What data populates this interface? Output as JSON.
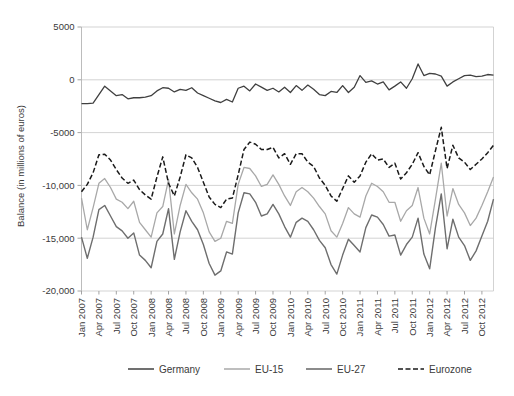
{
  "chart_data": {
    "type": "line",
    "title": "",
    "xlabel": "",
    "ylabel": "Balance (in millions of euros)",
    "ylim": [
      -20000,
      5000
    ],
    "yticks": [
      5000,
      0,
      -5000,
      -10000,
      -15000,
      -20000
    ],
    "ytick_labels": [
      "5000",
      "0",
      "-5000",
      "-10,000",
      "-15,000",
      "-20,000"
    ],
    "grid": true,
    "legend_position": "bottom",
    "x_start": "Jan 2007",
    "x_end": "Dec 2012",
    "x_tick_interval_months": 3,
    "xtick_labels": [
      "Jan 2007",
      "Apr 2007",
      "Jul 2007",
      "Oct 2007",
      "Jan 2008",
      "Apr 2008",
      "Jul 2008",
      "Oct 2008",
      "Jan 2009",
      "Apr 2009",
      "Jul 2009",
      "Oct 2009",
      "Jan 2010",
      "Apr 2010",
      "Jul 2010",
      "Oct 2010",
      "Jan 2011",
      "Apr 2011",
      "Jul 2011",
      "Oct 2011",
      "Jan 2012",
      "Apr 2012",
      "Jul 2012",
      "Oct 2012"
    ],
    "x": [
      "Jan 2007",
      "Feb 2007",
      "Mar 2007",
      "Apr 2007",
      "May 2007",
      "Jun 2007",
      "Jul 2007",
      "Aug 2007",
      "Sep 2007",
      "Oct 2007",
      "Nov 2007",
      "Dec 2007",
      "Jan 2008",
      "Feb 2008",
      "Mar 2008",
      "Apr 2008",
      "May 2008",
      "Jun 2008",
      "Jul 2008",
      "Aug 2008",
      "Sep 2008",
      "Oct 2008",
      "Nov 2008",
      "Dec 2008",
      "Jan 2009",
      "Feb 2009",
      "Mar 2009",
      "Apr 2009",
      "May 2009",
      "Jun 2009",
      "Jul 2009",
      "Aug 2009",
      "Sep 2009",
      "Oct 2009",
      "Nov 2009",
      "Dec 2009",
      "Jan 2010",
      "Feb 2010",
      "Mar 2010",
      "Apr 2010",
      "May 2010",
      "Jun 2010",
      "Jul 2010",
      "Aug 2010",
      "Sep 2010",
      "Oct 2010",
      "Nov 2010",
      "Dec 2010",
      "Jan 2011",
      "Feb 2011",
      "Mar 2011",
      "Apr 2011",
      "May 2011",
      "Jun 2011",
      "Jul 2011",
      "Aug 2011",
      "Sep 2011",
      "Oct 2011",
      "Nov 2011",
      "Dec 2011",
      "Jan 2012",
      "Feb 2012",
      "Mar 2012",
      "Apr 2012",
      "May 2012",
      "Jun 2012",
      "Jul 2012",
      "Aug 2012",
      "Sep 2012",
      "Oct 2012",
      "Nov 2012",
      "Dec 2012"
    ],
    "series": [
      {
        "name": "Germany",
        "color": "#404040",
        "width": 1.3,
        "dash": "none",
        "values": [
          -2250,
          -2250,
          -2200,
          -1400,
          -600,
          -1050,
          -1500,
          -1400,
          -1800,
          -1700,
          -1700,
          -1650,
          -1500,
          -1050,
          -750,
          -800,
          -1150,
          -900,
          -1000,
          -750,
          -1250,
          -1500,
          -1750,
          -2000,
          -2150,
          -1850,
          -2100,
          -800,
          -600,
          -1050,
          -400,
          -700,
          -1000,
          -800,
          -1150,
          -700,
          -1200,
          -550,
          -1000,
          -500,
          -900,
          -1400,
          -1500,
          -1100,
          -1200,
          -550,
          -1200,
          -700,
          400,
          -250,
          -100,
          -400,
          -200,
          -950,
          -600,
          -200,
          -800,
          100,
          1500,
          400,
          600,
          550,
          350,
          -600,
          -200,
          100,
          400,
          450,
          300,
          350,
          500,
          450
        ]
      },
      {
        "name": "EU-15",
        "color": "#a8a8a8",
        "width": 1.3,
        "dash": "none",
        "values": [
          -11200,
          -14200,
          -12100,
          -9800,
          -9350,
          -10200,
          -11300,
          -11600,
          -12200,
          -11500,
          -13500,
          -14200,
          -14900,
          -12600,
          -12000,
          -9450,
          -14600,
          -11900,
          -9900,
          -10700,
          -11300,
          -12600,
          -14400,
          -15300,
          -15000,
          -13400,
          -13600,
          -9900,
          -8300,
          -8400,
          -9100,
          -10100,
          -9900,
          -9000,
          -9900,
          -11000,
          -11900,
          -10600,
          -10200,
          -10600,
          -11200,
          -12000,
          -12700,
          -14300,
          -14900,
          -13600,
          -12100,
          -12700,
          -13000,
          -11000,
          -9800,
          -10100,
          -10600,
          -11600,
          -11600,
          -13400,
          -12400,
          -11900,
          -10200,
          -13100,
          -14600,
          -11300,
          -7900,
          -12900,
          -10300,
          -11800,
          -12600,
          -13800,
          -13100,
          -11900,
          -10600,
          -9200
        ]
      },
      {
        "name": "EU-27",
        "color": "#6e6e6e",
        "width": 1.4,
        "dash": "none",
        "values": [
          -14900,
          -16900,
          -14900,
          -12300,
          -11900,
          -12900,
          -13900,
          -14300,
          -15000,
          -14500,
          -16600,
          -17100,
          -17800,
          -15300,
          -14600,
          -12200,
          -17000,
          -14400,
          -12400,
          -13400,
          -14200,
          -15600,
          -17400,
          -18500,
          -18100,
          -16300,
          -16500,
          -12600,
          -10700,
          -10800,
          -11600,
          -12900,
          -12700,
          -11800,
          -12700,
          -13900,
          -14900,
          -13500,
          -13100,
          -13400,
          -14200,
          -15200,
          -15900,
          -17500,
          -18400,
          -16600,
          -15100,
          -15700,
          -16300,
          -14000,
          -12800,
          -13000,
          -13700,
          -14800,
          -14700,
          -16600,
          -15600,
          -14900,
          -13100,
          -16500,
          -17900,
          -14000,
          -10800,
          -16000,
          -13200,
          -14900,
          -15700,
          -17100,
          -16200,
          -14800,
          -13400,
          -11300
        ]
      },
      {
        "name": "Eurozone",
        "color": "#1a1a1a",
        "width": 1.5,
        "dash": "5,2.5",
        "values": [
          -10600,
          -9900,
          -8800,
          -7100,
          -7050,
          -7600,
          -8500,
          -9300,
          -9800,
          -9500,
          -10400,
          -10900,
          -11300,
          -9200,
          -7300,
          -9800,
          -11000,
          -9200,
          -7100,
          -7400,
          -8300,
          -9700,
          -11100,
          -11800,
          -12100,
          -11300,
          -11200,
          -9000,
          -6600,
          -5900,
          -6100,
          -6600,
          -6600,
          -6400,
          -7400,
          -7000,
          -8000,
          -7000,
          -7000,
          -7800,
          -8200,
          -9300,
          -10000,
          -11000,
          -11500,
          -10300,
          -9100,
          -9700,
          -9100,
          -7800,
          -7000,
          -7600,
          -7500,
          -8300,
          -7900,
          -9400,
          -8800,
          -8000,
          -6900,
          -8200,
          -9000,
          -6700,
          -4500,
          -8400,
          -6200,
          -7400,
          -7800,
          -8500,
          -8000,
          -7500,
          -6900,
          -6200
        ]
      }
    ]
  },
  "legend": {
    "items": [
      {
        "label": "Germany",
        "key": "germany"
      },
      {
        "label": "EU-15",
        "key": "eu15"
      },
      {
        "label": "EU-27",
        "key": "eu27"
      },
      {
        "label": "Eurozone",
        "key": "eurozone"
      }
    ]
  },
  "colors": {
    "germany": "#404040",
    "eu15": "#a8a8a8",
    "eu27": "#6e6e6e",
    "eurozone": "#1a1a1a",
    "gridline": "#c8c8c8",
    "text": "#3a3a3a",
    "background": "#ffffff"
  }
}
